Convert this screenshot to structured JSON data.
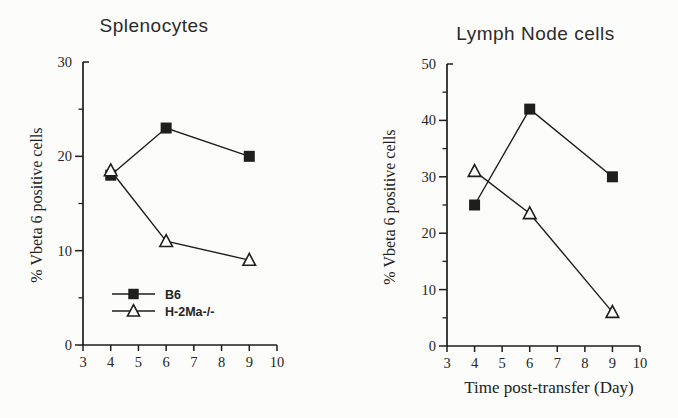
{
  "colors": {
    "ink": "#1e1e1e",
    "text": "#262626",
    "background": "#fcfcfa",
    "marker_fill": "#1e1e1e",
    "open_marker_fill": "#fcfcfa"
  },
  "chart_data": [
    {
      "type": "line",
      "title": "Splenocytes",
      "xlabel": "",
      "ylabel": "% Vbeta 6 positive cells",
      "x": [
        4,
        6,
        9
      ],
      "xlim": [
        3,
        10
      ],
      "ylim": [
        0,
        30
      ],
      "xticks": [
        3,
        4,
        5,
        6,
        7,
        8,
        9,
        10
      ],
      "yticks_major": [
        0,
        10,
        20,
        30
      ],
      "yticks_minor": [
        5,
        15,
        25
      ],
      "grid": false,
      "legend_position": "inside-lower-left",
      "series": [
        {
          "name": "B6",
          "marker": "filled-square",
          "values": [
            18,
            23,
            20
          ]
        },
        {
          "name": "H-2Ma-/-",
          "marker": "open-triangle",
          "values": [
            18.5,
            11,
            9
          ]
        }
      ]
    },
    {
      "type": "line",
      "title": "Lymph Node cells",
      "xlabel": "Time post-transfer (Day)",
      "ylabel": "% Vbeta 6 positive cells",
      "x": [
        4,
        6,
        9
      ],
      "xlim": [
        3,
        10
      ],
      "ylim": [
        0,
        50
      ],
      "xticks": [
        3,
        4,
        5,
        6,
        7,
        8,
        9,
        10
      ],
      "yticks_major": [
        0,
        10,
        20,
        30,
        40,
        50
      ],
      "yticks_minor": [
        5,
        15,
        25,
        35,
        45
      ],
      "grid": false,
      "legend_position": "none",
      "series": [
        {
          "name": "B6",
          "marker": "filled-square",
          "values": [
            25,
            42,
            30
          ]
        },
        {
          "name": "H-2Ma-/-",
          "marker": "open-triangle",
          "values": [
            31,
            23.5,
            6
          ]
        }
      ]
    }
  ]
}
